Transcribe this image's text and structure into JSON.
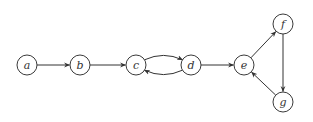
{
  "diagram": {
    "type": "directed-graph",
    "node_radius": 10,
    "colors": {
      "stroke": "#3a3a3a",
      "fill": "#ffffff",
      "label": "#333333"
    },
    "nodes": [
      {
        "id": "a",
        "label": "a",
        "x": 27,
        "y": 65
      },
      {
        "id": "b",
        "label": "b",
        "x": 80,
        "y": 65
      },
      {
        "id": "c",
        "label": "c",
        "x": 136,
        "y": 65
      },
      {
        "id": "d",
        "label": "d",
        "x": 191,
        "y": 65
      },
      {
        "id": "e",
        "label": "e",
        "x": 244,
        "y": 65
      },
      {
        "id": "f",
        "label": "f",
        "x": 283,
        "y": 24
      },
      {
        "id": "g",
        "label": "g",
        "x": 283,
        "y": 102
      }
    ],
    "edges": [
      {
        "from": "a",
        "to": "b",
        "curve": 0
      },
      {
        "from": "b",
        "to": "c",
        "curve": 0
      },
      {
        "from": "c",
        "to": "d",
        "curve": -1
      },
      {
        "from": "d",
        "to": "c",
        "curve": -1
      },
      {
        "from": "d",
        "to": "e",
        "curve": 0
      },
      {
        "from": "e",
        "to": "f",
        "curve": 0
      },
      {
        "from": "f",
        "to": "g",
        "curve": 0
      },
      {
        "from": "g",
        "to": "e",
        "curve": 0
      }
    ]
  }
}
